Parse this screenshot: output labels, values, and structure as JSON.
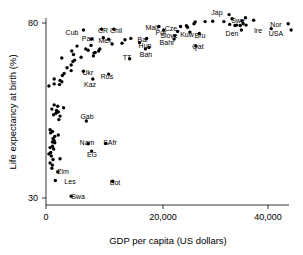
{
  "chart_data": {
    "type": "scatter",
    "title": "",
    "xlabel": "GDP per capita (US dollars)",
    "ylabel": "Life expectancy at birth (%)",
    "xlim": [
      -1500,
      44000
    ],
    "ylim": [
      28,
      84
    ],
    "xticks": [
      0,
      20000,
      40000
    ],
    "xticklabels": [
      "0",
      "20,000",
      "40,000"
    ],
    "yticks": [
      30,
      80
    ],
    "yticklabels": [
      "30",
      "80"
    ],
    "grid": false,
    "legend": null,
    "marker_color": "#000000",
    "marker_shape": "circle",
    "points": [
      {
        "label": "Swa",
        "x": 4300,
        "y": 30.5
      },
      {
        "label": "Les",
        "x": 1600,
        "y": 35.0
      },
      {
        "label": "Bot",
        "x": 11400,
        "y": 34.8
      },
      {
        "label": "Zim",
        "x": 2000,
        "y": 37.5
      },
      {
        "label": "Zam",
        "x": 1000,
        "y": 38.5
      },
      {
        "label": "CAR",
        "x": 1100,
        "y": 39.4
      },
      {
        "label": "Mala",
        "x": 700,
        "y": 40.0
      },
      {
        "label": "Moz",
        "x": 1200,
        "y": 41.0
      },
      {
        "label": "Ang",
        "x": 2400,
        "y": 41.2
      },
      {
        "label": "Afg",
        "x": 900,
        "y": 42.0
      },
      {
        "label": "Lib",
        "x": 500,
        "y": 42.6
      },
      {
        "label": "Nig",
        "x": 800,
        "y": 43.0
      },
      {
        "label": "EG",
        "x": 7800,
        "y": 43.4
      },
      {
        "label": "Rwa",
        "x": 1300,
        "y": 44.0
      },
      {
        "label": "Bur",
        "x": 700,
        "y": 44.4
      },
      {
        "label": "Mali",
        "x": 1100,
        "y": 44.8
      },
      {
        "label": "Nam",
        "x": 7200,
        "y": 45.5
      },
      {
        "label": "SAfr",
        "x": 10200,
        "y": 45.6
      },
      {
        "label": "Time",
        "x": 1500,
        "y": 45.8
      },
      {
        "label": "Tan",
        "x": 1100,
        "y": 46.0
      },
      {
        "label": "Chad",
        "x": 1400,
        "y": 46.4
      },
      {
        "label": "Uga",
        "x": 1200,
        "y": 47.0
      },
      {
        "label": "Ken",
        "x": 1500,
        "y": 47.6
      },
      {
        "label": "Cam",
        "x": 2100,
        "y": 48.0
      },
      {
        "label": "Eth",
        "x": 800,
        "y": 48.6
      },
      {
        "label": "Gui",
        "x": 1100,
        "y": 49.0
      },
      {
        "label": "Cong",
        "x": 700,
        "y": 49.5
      },
      {
        "label": "Gab",
        "x": 6900,
        "y": 52.0
      },
      {
        "label": "Djib",
        "x": 2200,
        "y": 52.4
      },
      {
        "label": "Gha",
        "x": 2400,
        "y": 53.4
      },
      {
        "label": "Ben",
        "x": 1300,
        "y": 53.8
      },
      {
        "label": "Sen",
        "x": 1700,
        "y": 54.2
      },
      {
        "label": "Sud",
        "x": 2100,
        "y": 54.6
      },
      {
        "label": "Hai",
        "x": 1800,
        "y": 55.0
      },
      {
        "label": "Mya",
        "x": 1000,
        "y": 55.4
      },
      {
        "label": "Bhu",
        "x": 3000,
        "y": 55.8
      },
      {
        "label": "Lao",
        "x": 2000,
        "y": 56.2
      },
      {
        "label": "Bot2",
        "x": 1400,
        "y": 56.6
      },
      {
        "label": "Bam",
        "x": 500,
        "y": 62.0
      },
      {
        "label": "Nep",
        "x": 1400,
        "y": 62.6
      },
      {
        "label": "Ind",
        "x": 2700,
        "y": 63.2
      },
      {
        "label": "Pak",
        "x": 2400,
        "y": 63.6
      },
      {
        "label": "Ban",
        "x": 1400,
        "y": 64.0
      },
      {
        "label": "Yem",
        "x": 2300,
        "y": 62.4
      },
      {
        "label": "Kaz",
        "x": 8000,
        "y": 64.0
      },
      {
        "label": "Rus",
        "x": 10700,
        "y": 65.4
      },
      {
        "label": "Ukr",
        "x": 6400,
        "y": 66.2
      },
      {
        "label": "Mong",
        "x": 2800,
        "y": 65.0
      },
      {
        "label": "Bol",
        "x": 3100,
        "y": 65.6
      },
      {
        "label": "Guat",
        "x": 4300,
        "y": 66.4
      },
      {
        "label": "Ind2",
        "x": 3600,
        "y": 67.2
      },
      {
        "label": "Mor",
        "x": 4300,
        "y": 68.0
      },
      {
        "label": "Egy",
        "x": 4600,
        "y": 69.0
      },
      {
        "label": "Phil",
        "x": 4900,
        "y": 69.4
      },
      {
        "label": "Viet",
        "x": 2700,
        "y": 70.0
      },
      {
        "label": "Per",
        "x": 6000,
        "y": 70.2
      },
      {
        "label": "Chin",
        "x": 4700,
        "y": 71.0
      },
      {
        "label": "Tur",
        "x": 8200,
        "y": 71.4
      },
      {
        "label": "Bra",
        "x": 8400,
        "y": 71.6
      },
      {
        "label": "Col",
        "x": 7200,
        "y": 72.2
      },
      {
        "label": "Thai",
        "x": 8100,
        "y": 70.6
      },
      {
        "label": "Ven",
        "x": 6800,
        "y": 72.6
      },
      {
        "label": "Sri",
        "x": 4400,
        "y": 72.0
      },
      {
        "label": "Alb",
        "x": 5300,
        "y": 73.4
      },
      {
        "label": "Tun",
        "x": 7700,
        "y": 73.6
      },
      {
        "label": "Arg",
        "x": 13000,
        "y": 74.2
      },
      {
        "label": "Rom",
        "x": 9000,
        "y": 72.0
      },
      {
        "label": "Bul",
        "x": 9200,
        "y": 72.6
      },
      {
        "label": "Pol",
        "x": 13500,
        "y": 75.2
      },
      {
        "label": "Mex",
        "x": 10700,
        "y": 75.4
      },
      {
        "label": "Uru",
        "x": 9800,
        "y": 75.8
      },
      {
        "label": "Pan",
        "x": 7800,
        "y": 75.4
      },
      {
        "label": "Mala",
        "x": 11300,
        "y": 74.0
      },
      {
        "label": "TT",
        "x": 14300,
        "y": 69.8
      },
      {
        "label": "Bah",
        "x": 17000,
        "y": 72.6
      },
      {
        "label": "Hun",
        "x": 17600,
        "y": 73.0
      },
      {
        "label": "Bar",
        "x": 17200,
        "y": 75.6
      },
      {
        "label": "Cub",
        "x": 6400,
        "y": 78.0
      },
      {
        "label": "CR",
        "x": 9500,
        "y": 78.2
      },
      {
        "label": "Chil",
        "x": 11600,
        "y": 78.2
      },
      {
        "label": "Cro",
        "x": 14500,
        "y": 75.6
      },
      {
        "label": "Slov",
        "x": 16000,
        "y": 74.4
      },
      {
        "label": "Bahr",
        "x": 21900,
        "y": 75.4
      },
      {
        "label": "Qat",
        "x": 25600,
        "y": 73.4
      },
      {
        "label": "Kuw",
        "x": 24600,
        "y": 77.4
      },
      {
        "label": "Bru",
        "x": 26200,
        "y": 77.0
      },
      {
        "label": "Malt",
        "x": 19300,
        "y": 79.0
      },
      {
        "label": "Cze",
        "x": 22000,
        "y": 76.4
      },
      {
        "label": "Por",
        "x": 20100,
        "y": 78.0
      },
      {
        "label": "Slove",
        "x": 22500,
        "y": 77.6
      },
      {
        "label": "Cyp",
        "x": 23000,
        "y": 79.0
      },
      {
        "label": "Gre",
        "x": 24000,
        "y": 79.2
      },
      {
        "label": "NZ",
        "x": 25300,
        "y": 79.8
      },
      {
        "label": "Kor",
        "x": 24200,
        "y": 78.8
      },
      {
        "label": "Spa",
        "x": 27200,
        "y": 80.4
      },
      {
        "label": "Ita",
        "x": 28500,
        "y": 80.5
      },
      {
        "label": "Isr",
        "x": 25500,
        "y": 80.3
      },
      {
        "label": "Fra",
        "x": 30400,
        "y": 80.4
      },
      {
        "label": "Ger",
        "x": 31400,
        "y": 79.6
      },
      {
        "label": "Fin",
        "x": 32300,
        "y": 79.3
      },
      {
        "label": "Bel",
        "x": 32600,
        "y": 79.4
      },
      {
        "label": "UK",
        "x": 33200,
        "y": 79.3
      },
      {
        "label": "Jap",
        "x": 31300,
        "y": 82.4
      },
      {
        "label": "Aus",
        "x": 31800,
        "y": 81.2
      },
      {
        "label": "Can",
        "x": 33500,
        "y": 80.6
      },
      {
        "label": "Swi",
        "x": 34100,
        "y": 81.5
      },
      {
        "label": "Aut",
        "x": 33700,
        "y": 79.8
      },
      {
        "label": "Neth",
        "x": 34200,
        "y": 79.4
      },
      {
        "label": "Swe",
        "x": 35500,
        "y": 80.8
      },
      {
        "label": "Den",
        "x": 33400,
        "y": 78.0
      },
      {
        "label": "Ire",
        "x": 38500,
        "y": 78.4
      },
      {
        "label": "Nor",
        "x": 41400,
        "y": 79.8
      },
      {
        "label": "USA",
        "x": 41900,
        "y": 78.0
      }
    ],
    "annotations": [
      {
        "text": "Cub",
        "x": 6400,
        "y": 78.0,
        "px": 72,
        "py": 35
      },
      {
        "text": "CR",
        "x": 9500,
        "y": 78.2,
        "px": 103,
        "py": 33
      },
      {
        "text": "Chil",
        "x": 11600,
        "y": 78.2,
        "px": 116,
        "py": 33
      },
      {
        "text": "Malt",
        "x": 19300,
        "y": 79.0,
        "px": 152,
        "py": 30
      },
      {
        "text": "Cze",
        "x": 22000,
        "y": 76.4,
        "px": 171,
        "py": 31
      },
      {
        "text": "Por",
        "x": 20100,
        "y": 78.0,
        "px": 161,
        "py": 35
      },
      {
        "text": "Slove",
        "x": 22500,
        "y": 77.6,
        "px": 169,
        "py": 38
      },
      {
        "text": "Kuw",
        "x": 24600,
        "y": 77.4,
        "px": 187,
        "py": 37
      },
      {
        "text": "Bru",
        "x": 26200,
        "y": 77.0,
        "px": 200,
        "py": 38
      },
      {
        "text": "Qat",
        "x": 25600,
        "y": 73.4,
        "px": 198,
        "py": 49
      },
      {
        "text": "Bahr",
        "x": 21900,
        "y": 75.4,
        "px": 167,
        "py": 45
      },
      {
        "text": "Bar",
        "x": 17200,
        "y": 75.6,
        "px": 143,
        "py": 42
      },
      {
        "text": "Hun",
        "x": 17600,
        "y": 73.0,
        "px": 145,
        "py": 48
      },
      {
        "text": "Bah",
        "x": 17000,
        "y": 72.6,
        "px": 146,
        "py": 57
      },
      {
        "text": "TT",
        "x": 14300,
        "y": 69.8,
        "px": 127,
        "py": 60
      },
      {
        "text": "Mex",
        "x": 10700,
        "y": 75.4,
        "px": 105,
        "py": 43
      },
      {
        "text": "Pan",
        "x": 7800,
        "y": 75.4,
        "px": 88,
        "py": 41
      },
      {
        "text": "Rus",
        "x": 10700,
        "y": 65.4,
        "px": 107,
        "py": 79
      },
      {
        "text": "Kaz",
        "x": 8000,
        "y": 64.0,
        "px": 90,
        "py": 87
      },
      {
        "text": "Ukr",
        "x": 6400,
        "y": 66.2,
        "px": 88,
        "py": 75
      },
      {
        "text": "Gab",
        "x": 6900,
        "y": 52.0,
        "px": 87,
        "py": 119
      },
      {
        "text": "Nam",
        "x": 7200,
        "y": 45.5,
        "px": 87,
        "py": 145
      },
      {
        "text": "SAfr",
        "x": 10200,
        "y": 45.6,
        "px": 110,
        "py": 145
      },
      {
        "text": "EG",
        "x": 7800,
        "y": 43.4,
        "px": 92,
        "py": 157
      },
      {
        "text": "Bot",
        "x": 11400,
        "y": 34.8,
        "px": 115,
        "py": 185
      },
      {
        "text": "Les",
        "x": 1600,
        "y": 35.0,
        "px": 70,
        "py": 184
      },
      {
        "text": "Swa",
        "x": 4300,
        "y": 30.5,
        "px": 78,
        "py": 199
      },
      {
        "text": "Zim",
        "x": 2000,
        "y": 37.5,
        "px": 63,
        "py": 174
      },
      {
        "text": "Jap",
        "x": 31300,
        "y": 82.4,
        "px": 217,
        "py": 15
      },
      {
        "text": "Swe",
        "x": 35500,
        "y": 80.8,
        "px": 238,
        "py": 23
      },
      {
        "text": "Den",
        "x": 33400,
        "y": 78.0,
        "px": 232,
        "py": 36
      },
      {
        "text": "Ire",
        "x": 38500,
        "y": 78.4,
        "px": 258,
        "py": 33
      },
      {
        "text": "Nor",
        "x": 41400,
        "y": 79.8,
        "px": 276,
        "py": 27
      },
      {
        "text": "USA",
        "x": 41900,
        "y": 78.0,
        "px": 276,
        "py": 36
      }
    ]
  },
  "axes": {
    "x_title": "GDP per capita (US dollars)",
    "y_title": "Life expectancy at birth (%)",
    "x_tick_labels": [
      "0",
      "20,000",
      "40,000"
    ],
    "y_tick_labels": [
      "80",
      "30"
    ]
  }
}
